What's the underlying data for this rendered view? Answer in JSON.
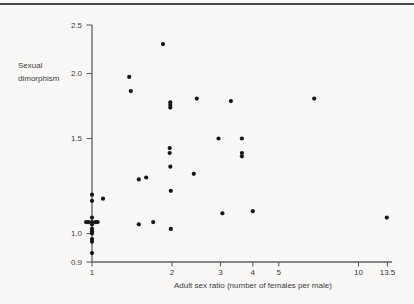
{
  "page": {
    "background": "#f9f8f6"
  },
  "chart_data": {
    "type": "scatter",
    "title": "",
    "xlabel": "Adult sex ratio (number of females per male)",
    "ylabel": "Sexual dimorphism",
    "ylabel_lines": [
      "Sexual",
      "dimorphism"
    ],
    "x_scale": "log",
    "y_scale": "log",
    "xlim": [
      0.95,
      14
    ],
    "ylim": [
      0.9,
      2.5
    ],
    "grid": false,
    "legend": false,
    "axis_color": "#5f5f5f",
    "text_color": "#3a3a3a",
    "marker": {
      "color": "#161616",
      "radius": 2.1
    },
    "x_ticks": [
      {
        "v": 1,
        "label": "1"
      },
      {
        "v": 2,
        "label": "2"
      },
      {
        "v": 3,
        "label": "3"
      },
      {
        "v": 4,
        "label": "4"
      },
      {
        "v": 5,
        "label": "5"
      },
      {
        "v": 10,
        "label": "10"
      },
      {
        "v": 13.5,
        "label": "13.5"
      }
    ],
    "y_ticks": [
      {
        "v": 0.9,
        "label": "0.9"
      },
      {
        "v": 1.0,
        "label": "1.0"
      },
      {
        "v": 1.5,
        "label": "1.5"
      },
      {
        "v": 2.0,
        "label": "2.0"
      },
      {
        "v": 2.5,
        "label": "2.5"
      }
    ],
    "points": [
      [
        1.85,
        2.29
      ],
      [
        1.38,
        1.97
      ],
      [
        1.4,
        1.85
      ],
      [
        2.46,
        1.79
      ],
      [
        6.8,
        1.79
      ],
      [
        3.29,
        1.77
      ],
      [
        1.97,
        1.76
      ],
      [
        1.97,
        1.74
      ],
      [
        1.97,
        1.72
      ],
      [
        2.95,
        1.5
      ],
      [
        3.63,
        1.5
      ],
      [
        1.96,
        1.44
      ],
      [
        3.63,
        1.41
      ],
      [
        1.96,
        1.41
      ],
      [
        3.63,
        1.39
      ],
      [
        1.97,
        1.33
      ],
      [
        2.4,
        1.29
      ],
      [
        1.6,
        1.27
      ],
      [
        1.5,
        1.26
      ],
      [
        1.98,
        1.2
      ],
      [
        1.0,
        1.18
      ],
      [
        1.1,
        1.16
      ],
      [
        1.0,
        1.15
      ],
      [
        4.0,
        1.1
      ],
      [
        3.05,
        1.09
      ],
      [
        1.0,
        1.07
      ],
      [
        13.4,
        1.07
      ],
      [
        0.95,
        1.05
      ],
      [
        0.97,
        1.05
      ],
      [
        1.03,
        1.05
      ],
      [
        1.05,
        1.05
      ],
      [
        1.7,
        1.05
      ],
      [
        1.0,
        1.05
      ],
      [
        1.0,
        1.04
      ],
      [
        1.5,
        1.04
      ],
      [
        1.0,
        1.02
      ],
      [
        1.98,
        1.02
      ],
      [
        1.0,
        1.01
      ],
      [
        1.0,
        1.0
      ],
      [
        1.0,
        0.98
      ],
      [
        1.0,
        0.97
      ],
      [
        1.0,
        0.93
      ]
    ]
  }
}
